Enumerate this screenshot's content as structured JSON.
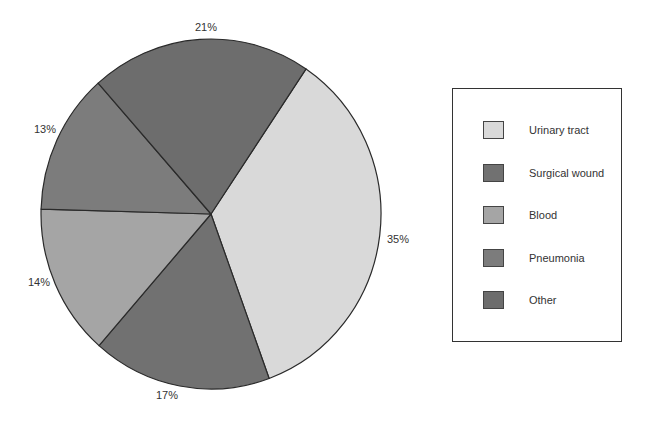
{
  "chart_data": {
    "type": "pie",
    "title": "",
    "categories": [
      "Urinary tract",
      "Surgical wound",
      "Blood",
      "Pneumonia",
      "Other"
    ],
    "values": [
      35,
      17,
      14,
      13,
      21
    ],
    "value_labels": [
      "35%",
      "17%",
      "14%",
      "13%",
      "21%"
    ],
    "colors": [
      "#d9d9d9",
      "#717171",
      "#a5a5a5",
      "#7c7c7c",
      "#6d6d6d"
    ],
    "start_angle_deg": -56,
    "direction": "clockwise",
    "legend_position": "right",
    "legend": [
      {
        "label": "Urinary tract",
        "color": "#d9d9d9"
      },
      {
        "label": "Surgical wound",
        "color": "#717171"
      },
      {
        "label": "Blood",
        "color": "#a5a5a5"
      },
      {
        "label": "Pneumonia",
        "color": "#7c7c7c"
      },
      {
        "label": "Other",
        "color": "#6d6d6d"
      }
    ]
  },
  "labels": {
    "urinary": "35%",
    "surgical": "17%",
    "blood": "14%",
    "pneumonia": "13%",
    "other": "21%"
  }
}
